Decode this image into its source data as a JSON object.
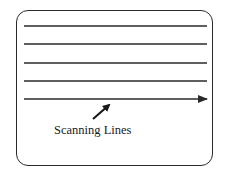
{
  "diagram": {
    "caption": "Scanning Lines",
    "line_count": 5,
    "line_y": [
      26,
      44,
      63,
      81,
      99
    ],
    "line_x_start": 24,
    "line_x_end": 207,
    "last_line_has_arrowhead": true,
    "pointer_arrow": {
      "from": [
        93,
        119
      ],
      "to": [
        110,
        104
      ]
    },
    "colors": {
      "stroke": "#2a2a2a",
      "background": "#ffffff",
      "text": "#1a1a1a"
    }
  }
}
